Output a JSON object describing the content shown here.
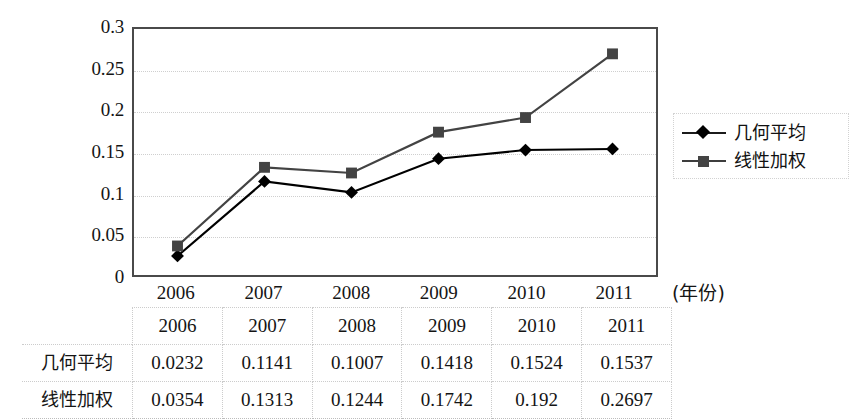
{
  "chart_data": {
    "type": "line",
    "title": "",
    "xlabel": "(年份)",
    "ylabel": "",
    "categories": [
      "2006",
      "2007",
      "2008",
      "2009",
      "2010",
      "2011"
    ],
    "ylim": [
      0,
      0.3
    ],
    "yticks": [
      "0",
      "0.05",
      "0.1",
      "0.15",
      "0.2",
      "0.25",
      "0.3"
    ],
    "ytick_values": [
      0,
      0.05,
      0.1,
      0.15,
      0.2,
      0.25,
      0.3
    ],
    "grid": true,
    "legend_position": "right",
    "series": [
      {
        "name": "几何平均",
        "marker": "diamond",
        "color": "#000000",
        "values": [
          0.0232,
          0.1141,
          0.1007,
          0.1418,
          0.1524,
          0.1537
        ]
      },
      {
        "name": "线性加权",
        "marker": "square",
        "color": "#434343",
        "values": [
          0.0354,
          0.1313,
          0.1244,
          0.1742,
          0.192,
          0.2697
        ]
      }
    ]
  },
  "legend": {
    "items": [
      {
        "label": "几何平均",
        "marker": "diamond"
      },
      {
        "label": "线性加权",
        "marker": "square"
      }
    ]
  },
  "axis": {
    "y_ticks": [
      "0.3",
      "0.25",
      "0.2",
      "0.15",
      "0.1",
      "0.05",
      "0"
    ],
    "x_ticks": [
      "2006",
      "2007",
      "2008",
      "2009",
      "2010",
      "2011"
    ],
    "x_unit_label": "(年份)"
  },
  "table": {
    "column_headers": [
      "",
      "2006",
      "2007",
      "2008",
      "2009",
      "2010",
      "2011"
    ],
    "rows": [
      {
        "label": "几何平均",
        "cells": [
          "0.0232",
          "0.1141",
          "0.1007",
          "0.1418",
          "0.1524",
          "0.1537"
        ]
      },
      {
        "label": "线性加权",
        "cells": [
          "0.0354",
          "0.1313",
          "0.1244",
          "0.1742",
          "0.192",
          "0.2697"
        ]
      }
    ]
  },
  "colors": {
    "series_geometric": "#000000",
    "series_linear_weighted": "#434343",
    "plot_border": "#4a4a4a",
    "gridline": "#cfcfcf"
  }
}
